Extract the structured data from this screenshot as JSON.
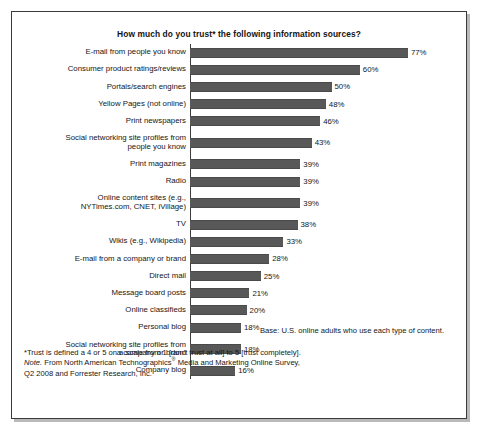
{
  "chart_data": {
    "type": "bar",
    "orientation": "horizontal",
    "title": "How much do you trust* the following information sources?",
    "xlabel": "",
    "ylabel": "",
    "xlim": [
      0,
      80
    ],
    "grid": false,
    "legend": "none",
    "value_suffix": "%",
    "categories": [
      "E-mail from people you know",
      "Consumer product ratings/reviews",
      "Portals/search engines",
      "Yellow Pages (not online)",
      "Print newspapers",
      "Social networking site profiles from\npeople you know",
      "Print magazines",
      "Radio",
      "Online content sites (e.g.,\nNYTimes.com, CNET, iVillage)",
      "TV",
      "Wikis (e.g., Wikipedia)",
      "E-mail from a company or brand",
      "Direct mail",
      "Message board posts",
      "Online classifieds",
      "Personal blog",
      "Social networking site profiles from\na company or brand",
      "Company blog"
    ],
    "values": [
      77,
      60,
      50,
      48,
      46,
      43,
      39,
      39,
      39,
      38,
      33,
      28,
      25,
      21,
      20,
      18,
      18,
      16
    ],
    "value_labels": [
      "77%",
      "60%",
      "50%",
      "48%",
      "46%",
      "43%",
      "39%",
      "39%",
      "39%",
      "38%",
      "33%",
      "28%",
      "25%",
      "21%",
      "20%",
      "18%",
      "18%",
      "16%"
    ],
    "bar_color": "#585858",
    "axis_color": "#3d3d3d",
    "background_color": "#ffffff"
  },
  "notes": {
    "base": "Base: U.S. online adults who use each type of content.",
    "footnote_asterisk": "*Trust is defined a 4 or 5 on a scale from 1 [don't trust at all] to 5 [trust completely].",
    "source_label": "Note.",
    "source_line1_a": " From North American Technographics",
    "source_registered": "®",
    "source_line1_b": " Media and Marketing Online Survey,",
    "source_line2": "Q2 2008 and Forrester Research, Inc."
  }
}
